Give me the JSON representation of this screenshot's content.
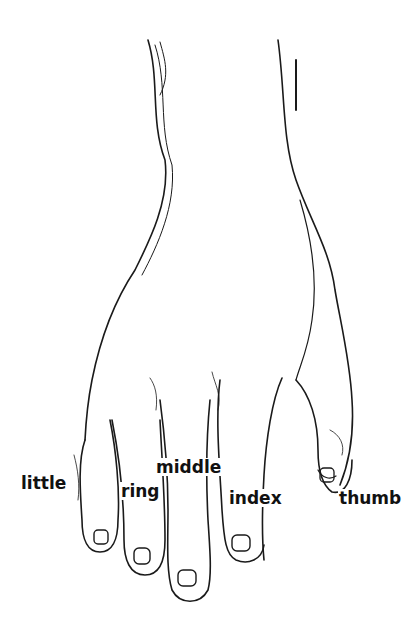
{
  "figure": {
    "labels": {
      "little": "little",
      "ring": "ring",
      "middle": "middle",
      "index": "index",
      "thumb": "thumb"
    }
  }
}
